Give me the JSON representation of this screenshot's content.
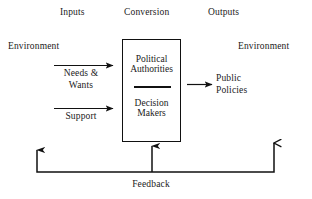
{
  "diagram": {
    "background_color": "#ffffff",
    "line_color": "#111111",
    "text_color": "#1a1a1a",
    "headers": [
      {
        "label": "Inputs"
      },
      {
        "label": "Conversion"
      },
      {
        "label": "Outputs"
      }
    ],
    "environment": {
      "left_label": "Environment",
      "right_label": "Environment"
    },
    "inputs": [
      {
        "label_line1": "Needs &",
        "label_line2": "Wants"
      },
      {
        "label_line1": "Support",
        "label_line2": ""
      }
    ],
    "conversion_box": {
      "top_line1": "Political",
      "top_line2": "Authorities",
      "bottom_line1": "Decision",
      "bottom_line2": "Makers"
    },
    "outputs": [
      {
        "label_line1": "Public",
        "label_line2": "Policies"
      }
    ],
    "feedback": {
      "label": "Feedback"
    }
  }
}
